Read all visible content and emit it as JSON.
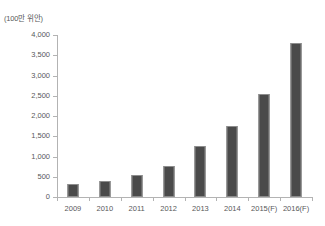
{
  "chart_data": {
    "type": "bar",
    "title": "",
    "subtitle": "",
    "unit_label": "(100만 위안)",
    "xlabel": "",
    "ylabel": "",
    "categories": [
      "2009",
      "2010",
      "2011",
      "2012",
      "2013",
      "2014",
      "2015(F)",
      "2016(F)"
    ],
    "values": [
      320,
      400,
      540,
      770,
      1250,
      1750,
      2550,
      3800
    ],
    "series": [
      {
        "name": "",
        "values": [
          320,
          400,
          540,
          770,
          1250,
          1750,
          2550,
          3800
        ]
      }
    ],
    "ylim": [
      0,
      4000
    ],
    "ytick_values": [
      0,
      500,
      1000,
      1500,
      2000,
      2500,
      3000,
      3500,
      4000
    ],
    "ytick_labels": [
      "0",
      "500",
      "1,000",
      "1,500",
      "2,000",
      "2,500",
      "3,000",
      "3,500",
      "4,000"
    ],
    "grid": false,
    "legend": false,
    "legend_position": "none",
    "bar_color": "#4a4a4a",
    "bar_edge_color": "#8d8d8d",
    "axis_color": "#b3b3b3",
    "text_color": "#58585a",
    "background_color": "#ffffff"
  }
}
